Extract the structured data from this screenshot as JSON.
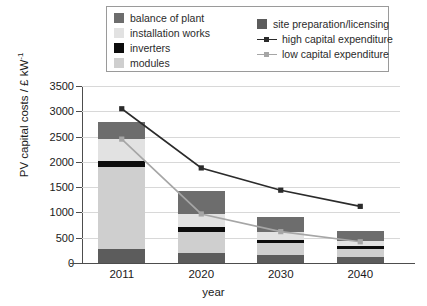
{
  "legend": {
    "items": [
      {
        "label": "balance of plant",
        "key": "balance_of_plant",
        "type": "swatch",
        "color": "#6d6d6d"
      },
      {
        "label": "installation works",
        "key": "installation_works",
        "type": "swatch",
        "color": "#e2e2e2"
      },
      {
        "label": "inverters",
        "key": "inverters",
        "type": "swatch",
        "color": "#0d0d0d"
      },
      {
        "label": "modules",
        "key": "modules",
        "type": "swatch",
        "color": "#cfcfcf"
      },
      {
        "label": "site preparation/licensing",
        "key": "site_preparation",
        "type": "swatch",
        "color": "#5c5c5c"
      },
      {
        "label": "high capital expenditure",
        "key": "high_capex",
        "type": "line",
        "color": "#2b2b2b"
      },
      {
        "label": "low capital expenditure",
        "key": "low_capex",
        "type": "line",
        "color": "#a6a6a6"
      }
    ]
  },
  "axes": {
    "ylabel_text": "PV capital costs / £ kW",
    "ylabel_sup": "-1",
    "xlabel": "year",
    "yticks": [
      "0",
      "500",
      "1000",
      "1500",
      "2000",
      "2500",
      "3000",
      "3500"
    ],
    "ytick_values": [
      0,
      500,
      1000,
      1500,
      2000,
      2500,
      3000,
      3500
    ],
    "ymin": 0,
    "ymax": 3500,
    "xticks": [
      "2011",
      "2020",
      "2030",
      "2040"
    ]
  },
  "chart_data": {
    "type": "bar",
    "title": "",
    "subtitle": "",
    "xlabel": "year",
    "ylabel": "PV capital costs / £ kW-1",
    "ylim": [
      0,
      3500
    ],
    "grid": true,
    "legend_position": "top",
    "stacked": true,
    "categories": [
      "2011",
      "2020",
      "2030",
      "2040"
    ],
    "series": [
      {
        "name": "site preparation/licensing",
        "color": "#5c5c5c",
        "kind": "bar",
        "values": [
          270,
          200,
          150,
          110
        ]
      },
      {
        "name": "modules",
        "color": "#cfcfcf",
        "kind": "bar",
        "values": [
          1620,
          420,
          250,
          170
        ]
      },
      {
        "name": "inverters",
        "color": "#0d0d0d",
        "kind": "bar",
        "values": [
          130,
          90,
          60,
          50
        ]
      },
      {
        "name": "installation works",
        "color": "#e2e2e2",
        "kind": "bar",
        "values": [
          430,
          260,
          160,
          110
        ]
      },
      {
        "name": "balance of plant",
        "color": "#6d6d6d",
        "kind": "bar",
        "values": [
          330,
          460,
          280,
          200
        ]
      },
      {
        "name": "high capital expenditure",
        "color": "#2b2b2b",
        "kind": "line",
        "marker": "square",
        "values": [
          3050,
          1880,
          1440,
          1120
        ]
      },
      {
        "name": "low capital expenditure",
        "color": "#a6a6a6",
        "kind": "line",
        "marker": "square",
        "values": [
          2450,
          970,
          620,
          420
        ]
      }
    ],
    "stack_totals": [
      2780,
      1430,
      900,
      640
    ]
  }
}
